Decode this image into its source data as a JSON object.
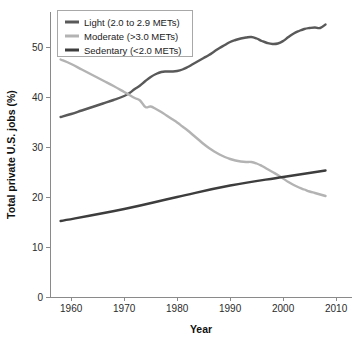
{
  "chart_data": {
    "type": "line",
    "title": "",
    "xlabel": "Year",
    "ylabel": "Total private U.S. jobs (%)",
    "xlim": [
      1956,
      2013
    ],
    "ylim": [
      0,
      57
    ],
    "xticks": [
      1960,
      1970,
      1980,
      1990,
      2000,
      2010
    ],
    "yticks": [
      0,
      10,
      20,
      30,
      40,
      50
    ],
    "grid": false,
    "legend_position": "top-left",
    "series": [
      {
        "name": "Light (2.0 to 2.9 METs)",
        "color": "#595959",
        "x": [
          1958,
          1960,
          1962,
          1964,
          1966,
          1968,
          1970,
          1971,
          1972,
          1973,
          1974,
          1975,
          1976,
          1977,
          1978,
          1979,
          1980,
          1981,
          1982,
          1983,
          1984,
          1985,
          1986,
          1987,
          1988,
          1989,
          1990,
          1991,
          1992,
          1993,
          1994,
          1995,
          1996,
          1997,
          1998,
          1999,
          2000,
          2001,
          2002,
          2003,
          2004,
          2005,
          2006,
          2007,
          2008
        ],
        "values": [
          36.0,
          36.6,
          37.3,
          38.0,
          38.7,
          39.4,
          40.2,
          40.8,
          41.6,
          42.3,
          43.2,
          44.0,
          44.6,
          45.0,
          45.1,
          45.1,
          45.2,
          45.5,
          46.0,
          46.6,
          47.2,
          47.8,
          48.4,
          49.1,
          49.8,
          50.4,
          51.0,
          51.4,
          51.7,
          51.9,
          52.0,
          51.7,
          51.2,
          50.8,
          50.6,
          50.7,
          51.2,
          52.0,
          52.7,
          53.2,
          53.6,
          53.8,
          53.9,
          53.8,
          54.5
        ]
      },
      {
        "name": "Moderate (>3.0 METs)",
        "color": "#b3b3b3",
        "x": [
          1958,
          1960,
          1962,
          1964,
          1966,
          1968,
          1970,
          1971,
          1972,
          1973,
          1974,
          1975,
          1976,
          1977,
          1978,
          1979,
          1980,
          1981,
          1982,
          1983,
          1984,
          1985,
          1986,
          1987,
          1988,
          1989,
          1990,
          1991,
          1992,
          1993,
          1994,
          1995,
          1996,
          1997,
          1998,
          1999,
          2000,
          2001,
          2002,
          2003,
          2004,
          2005,
          2006,
          2007,
          2008
        ],
        "values": [
          47.5,
          46.6,
          45.5,
          44.4,
          43.3,
          42.2,
          41.0,
          40.4,
          39.8,
          39.3,
          38.0,
          38.1,
          37.6,
          37.0,
          36.3,
          35.6,
          34.9,
          34.1,
          33.3,
          32.4,
          31.5,
          30.6,
          29.8,
          29.1,
          28.5,
          28.0,
          27.6,
          27.3,
          27.1,
          27.0,
          27.0,
          26.7,
          26.2,
          25.6,
          25.0,
          24.4,
          23.7,
          23.0,
          22.4,
          21.9,
          21.5,
          21.1,
          20.8,
          20.5,
          20.2
        ]
      },
      {
        "name": "Sedentary (<2.0 METs)",
        "color": "#3d3d3d",
        "x": [
          1958,
          1970,
          1980,
          1990,
          2000,
          2008
        ],
        "values": [
          15.2,
          17.6,
          20.0,
          22.3,
          24.0,
          25.3
        ]
      }
    ]
  },
  "legend": {
    "entries": [
      {
        "label": "Light (2.0 to 2.9 METs)",
        "color": "#595959"
      },
      {
        "label": "Moderate (>3.0 METs)",
        "color": "#b3b3b3"
      },
      {
        "label": "Sedentary (<2.0 METs)",
        "color": "#3d3d3d"
      }
    ]
  },
  "axes": {
    "x_title": "Year",
    "y_title": "Total private U.S. jobs (%)"
  }
}
